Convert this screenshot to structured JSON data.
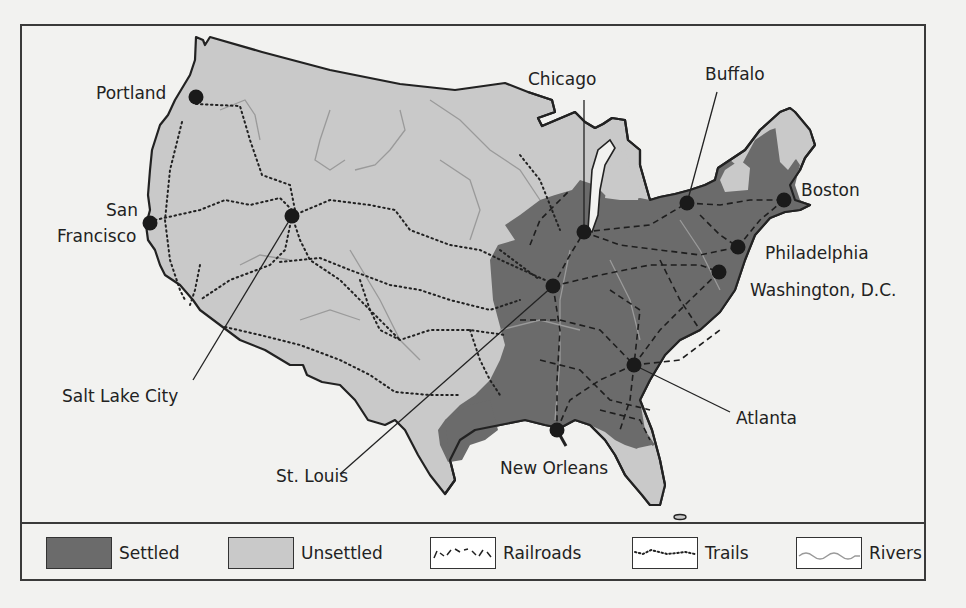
{
  "map": {
    "title": "",
    "colors": {
      "settled": "#6b6b6b",
      "unsettled": "#c9c9c9",
      "outline": "#222222",
      "water": "#f2f2f0",
      "rivers": "#9a9a9a"
    },
    "cities": [
      {
        "name": "Portland",
        "x": 196,
        "y": 97
      },
      {
        "name": "San Francisco",
        "name_line1": "San",
        "name_line2": "Francisco",
        "x": 150,
        "y": 223
      },
      {
        "name": "Salt Lake City",
        "x": 292,
        "y": 216
      },
      {
        "name": "Chicago",
        "x": 584,
        "y": 232
      },
      {
        "name": "Buffalo",
        "x": 687,
        "y": 203
      },
      {
        "name": "Boston",
        "x": 784,
        "y": 200
      },
      {
        "name": "Philadelphia",
        "x": 738,
        "y": 247
      },
      {
        "name": "Washington, D.C.",
        "x": 719,
        "y": 272
      },
      {
        "name": "St. Louis",
        "x": 553,
        "y": 286
      },
      {
        "name": "Atlanta",
        "x": 634,
        "y": 365
      },
      {
        "name": "New Orleans",
        "x": 557,
        "y": 430
      }
    ]
  },
  "legend": {
    "items": [
      {
        "label": "Settled",
        "icon": "settled-swatch"
      },
      {
        "label": "Unsettled",
        "icon": "unsettled-swatch"
      },
      {
        "label": "Railroads",
        "icon": "railroad-dashed-line"
      },
      {
        "label": "Trails",
        "icon": "trail-dotted-line"
      },
      {
        "label": "Rivers",
        "icon": "river-wavy-line"
      }
    ]
  }
}
